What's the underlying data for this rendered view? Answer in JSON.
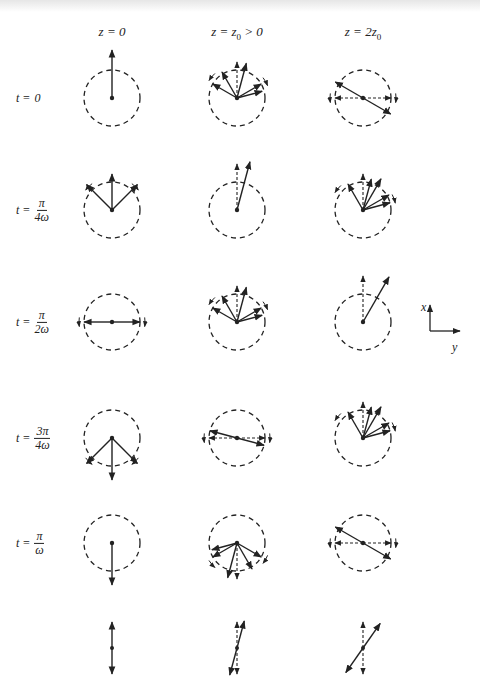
{
  "figure": {
    "columns": [
      {
        "id": "z0",
        "label_html": "z = 0",
        "x": 112
      },
      {
        "id": "z1",
        "label_html": "z = z<sub>0</sub> > 0",
        "x": 237
      },
      {
        "id": "z2",
        "label_html": "z = 2z<sub>0</sub>",
        "x": 363
      }
    ],
    "rows": [
      {
        "id": "t0",
        "prefix": "t = ",
        "plain": "0",
        "y": 98
      },
      {
        "id": "t1",
        "prefix": "t = ",
        "num": "π",
        "den": "4ω",
        "y": 210
      },
      {
        "id": "t2",
        "prefix": "t = ",
        "num": "π",
        "den": "2ω",
        "y": 322
      },
      {
        "id": "t3",
        "prefix": "t = ",
        "num": "3π",
        "den": "4ω",
        "y": 438
      },
      {
        "id": "t4",
        "prefix": "t = ",
        "num": "π",
        "den": "ω",
        "y": 543
      },
      {
        "id": "summary",
        "prefix": "",
        "plain": "",
        "y": 648
      }
    ],
    "circle_radius": 28,
    "cells": [
      [
        {
          "vectors": [
            [
              90,
              48
            ]
          ],
          "dashed": [],
          "rot": []
        },
        {
          "vectors": [
            [
              45,
              36
            ],
            [
              90,
              36
            ],
            [
              135,
              36
            ]
          ],
          "dashed": [],
          "rot": [
            [
              135,
              "ccw"
            ],
            [
              45,
              "cw"
            ]
          ]
        },
        {
          "vectors": [
            [
              0,
              28
            ],
            [
              180,
              28
            ]
          ],
          "dashed": [],
          "rot": [
            [
              180,
              "ccw"
            ],
            [
              0,
              "cw"
            ]
          ]
        },
        {
          "vectors": [
            [
              -45,
              36
            ],
            [
              -90,
              42
            ],
            [
              -135,
              36
            ]
          ],
          "dashed": [],
          "rot": [
            [
              -135,
              "ccw"
            ],
            [
              -45,
              "cw"
            ]
          ]
        },
        {
          "vectors": [
            [
              -90,
              42
            ]
          ],
          "dashed": [],
          "rot": []
        }
      ],
      [
        {
          "vectors": [
            [
              75,
              36
            ],
            [
              120,
              30
            ],
            [
              150,
              28
            ],
            [
              30,
              28
            ],
            [
              15,
              26
            ]
          ],
          "dashed": [
            [
              90,
              36
            ]
          ],
          "rot": [
            [
              140,
              "ccw"
            ],
            [
              30,
              "cw"
            ]
          ]
        },
        {
          "vectors": [
            [
              75,
              50
            ]
          ],
          "dashed": [
            [
              90,
              46
            ]
          ],
          "rot": []
        },
        {
          "vectors": [
            [
              75,
              36
            ],
            [
              120,
              30
            ],
            [
              150,
              28
            ],
            [
              30,
              28
            ],
            [
              15,
              26
            ]
          ],
          "dashed": [
            [
              90,
              36
            ]
          ],
          "rot": [
            [
              140,
              "ccw"
            ],
            [
              30,
              "cw"
            ]
          ]
        },
        {
          "vectors": [
            [
              165,
              28
            ],
            [
              -15,
              28
            ]
          ],
          "dashed": [
            [
              180,
              28
            ],
            [
              0,
              28
            ]
          ],
          "rot": [
            [
              180,
              "ccw"
            ],
            [
              0,
              "cw"
            ]
          ]
        },
        {
          "vectors": [
            [
              -105,
              36
            ],
            [
              -60,
              30
            ],
            [
              -30,
              28
            ],
            [
              -150,
              28
            ],
            [
              -165,
              26
            ]
          ],
          "dashed": [
            [
              -90,
              36
            ]
          ],
          "rot": [
            [
              -140,
              "ccw"
            ],
            [
              -30,
              "cw"
            ]
          ]
        }
      ],
      [
        {
          "vectors": [
            [
              150,
              32
            ],
            [
              -30,
              32
            ]
          ],
          "dashed": [
            [
              180,
              28
            ],
            [
              0,
              28
            ]
          ],
          "rot": [
            [
              180,
              "ccw"
            ],
            [
              0,
              "cw"
            ]
          ]
        },
        {
          "vectors": [
            [
              60,
              36
            ],
            [
              75,
              32
            ],
            [
              120,
              30
            ],
            [
              30,
              30
            ],
            [
              15,
              28
            ]
          ],
          "dashed": [
            [
              90,
              36
            ]
          ],
          "rot": [
            [
              140,
              "ccw"
            ],
            [
              20,
              "cw"
            ]
          ]
        },
        {
          "vectors": [
            [
              60,
              52
            ]
          ],
          "dashed": [
            [
              90,
              46
            ]
          ],
          "rot": []
        },
        {
          "vectors": [
            [
              60,
              36
            ],
            [
              75,
              32
            ],
            [
              120,
              30
            ],
            [
              30,
              30
            ],
            [
              15,
              28
            ]
          ],
          "dashed": [
            [
              90,
              36
            ]
          ],
          "rot": [
            [
              140,
              "ccw"
            ],
            [
              20,
              "cw"
            ]
          ]
        },
        {
          "vectors": [
            [
              150,
              32
            ],
            [
              -30,
              32
            ]
          ],
          "dashed": [
            [
              180,
              28
            ],
            [
              0,
              28
            ]
          ],
          "rot": [
            [
              180,
              "ccw"
            ],
            [
              0,
              "cw"
            ]
          ]
        }
      ]
    ],
    "summary_row": [
      {
        "vectors": [
          [
            90,
            26
          ],
          [
            -90,
            26
          ]
        ],
        "dashed": []
      },
      {
        "vectors": [
          [
            75,
            28
          ],
          [
            -105,
            28
          ]
        ],
        "dashed": [
          [
            90,
            26
          ],
          [
            -90,
            26
          ]
        ]
      },
      {
        "vectors": [
          [
            55,
            30
          ],
          [
            -125,
            30
          ]
        ],
        "dashed": [
          [
            90,
            26
          ],
          [
            -90,
            26
          ]
        ]
      }
    ],
    "axes_legend": {
      "x_label": "x",
      "y_label": "y",
      "origin_x": 430,
      "origin_y": 331
    }
  },
  "colors": {
    "ink": "#222222",
    "background": "#ffffff"
  }
}
